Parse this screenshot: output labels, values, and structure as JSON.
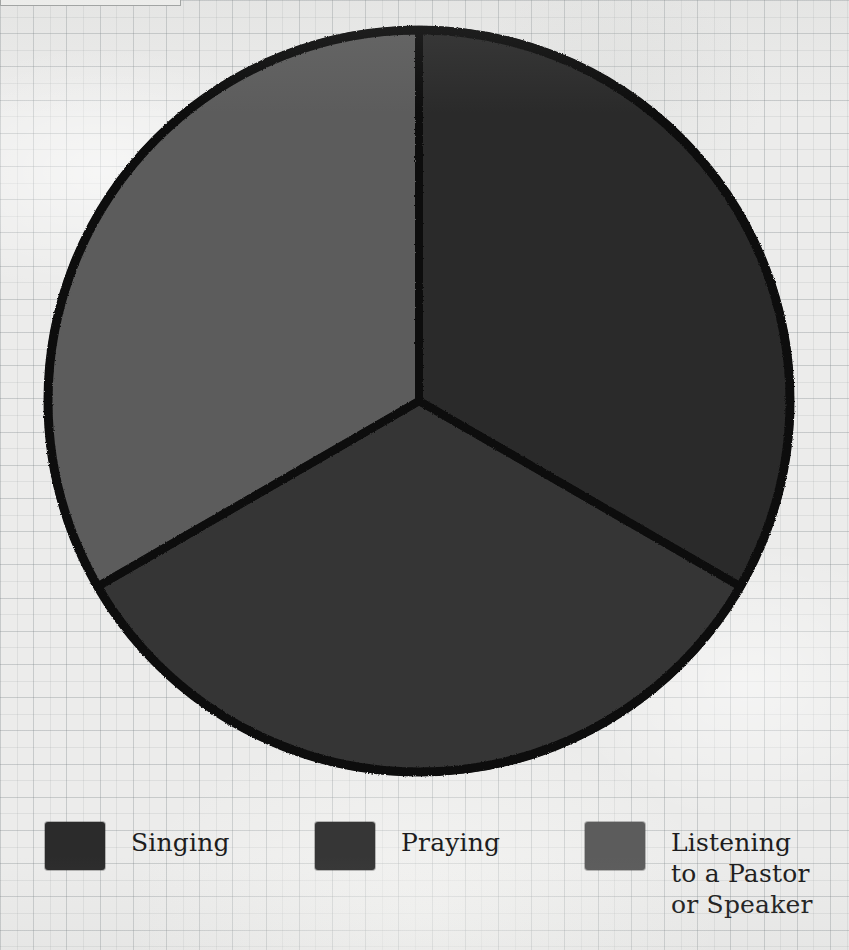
{
  "background": {
    "paper_color": "#ececeb",
    "grid_color": "#c3c8c9",
    "style": "graph-paper-scan"
  },
  "top_clipped_box": {
    "name": "clipped-caption-box",
    "visible_text": ""
  },
  "chart_data": {
    "type": "pie",
    "title": "",
    "categories": [
      "Singing",
      "Praying",
      "Listening to a Pastor or Speaker"
    ],
    "values": [
      33.3,
      33.3,
      33.3
    ],
    "value_unit": "percent",
    "start_angle_deg": 0,
    "direction": "clockwise",
    "colors": [
      "#2b2b2b",
      "#363636",
      "#5c5c5c"
    ],
    "slice_border_color": "#111111",
    "slice_border_width": 8,
    "outline_color": "#111111",
    "legend_position": "bottom",
    "data_labels_shown": false,
    "gridlines": false,
    "xlabel": "",
    "ylabel": "",
    "center_x": 419,
    "center_y": 401,
    "radius": 371
  },
  "legend": {
    "items": [
      {
        "label": "Singing",
        "color": "#2b2b2b"
      },
      {
        "label": "Praying",
        "color": "#363636"
      },
      {
        "label": "Listening\nto a Pastor\nor Speaker",
        "color": "#5c5c5c"
      }
    ]
  }
}
